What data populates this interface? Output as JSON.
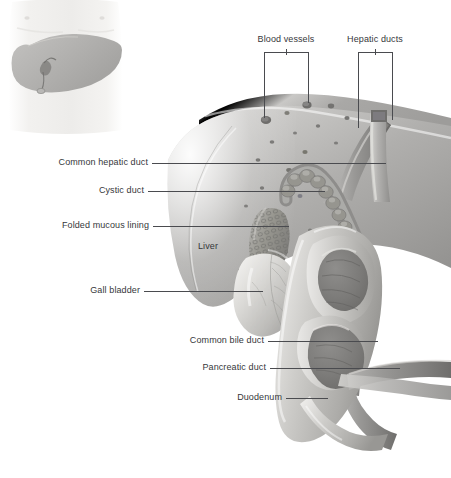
{
  "figure": {
    "style": "grayscale medical illustration",
    "width": 451,
    "height": 478,
    "background": "#ffffff",
    "ink": "#36373a",
    "leader_color": "#4a4b4f"
  },
  "inset": {
    "name": "torso-liver-locator",
    "description": "faint torso outline with shaded liver silhouette",
    "skin": "#efeeec",
    "organ": "#b9b8b6"
  },
  "labels": {
    "blood_vessels": "Blood vessels",
    "hepatic_ducts": "Hepatic ducts",
    "common_hepatic_duct": "Common hepatic duct",
    "cystic_duct": "Cystic duct",
    "folded_mucous_lining": "Folded mucous lining",
    "liver": "Liver",
    "gall_bladder": "Gall bladder",
    "common_bile_duct": "Common bile duct",
    "pancreatic_duct": "Pancreatic duct",
    "duodenum": "Duodenum"
  },
  "anatomy_parts": [
    {
      "name": "liver",
      "tone": "#a9a8a6"
    },
    {
      "name": "gall-bladder",
      "tone": "#cfcdca"
    },
    {
      "name": "cystic-duct",
      "tone": "#9c9b99"
    },
    {
      "name": "common-hepatic-duct",
      "tone": "#8f8e8c"
    },
    {
      "name": "hepatic-ducts",
      "tone": "#8f8e8c"
    },
    {
      "name": "common-bile-duct",
      "tone": "#8a8987"
    },
    {
      "name": "pancreatic-duct",
      "tone": "#9a9997"
    },
    {
      "name": "duodenum",
      "tone": "#b5b3b0"
    },
    {
      "name": "folded-mucous-lining",
      "tone": "#8d8c8a"
    },
    {
      "name": "blood-vessels",
      "tone": "#6f6e6c"
    }
  ]
}
